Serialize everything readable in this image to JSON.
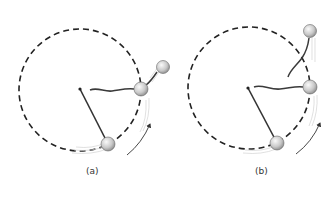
{
  "figure": {
    "panels": [
      {
        "id": "a",
        "caption": "(a)",
        "caption_pos": [
          92,
          172
        ],
        "circle": {
          "cx": 80,
          "cy": 90,
          "r": 61
        },
        "pivot": [
          80,
          89
        ],
        "rod_ball": [
          108,
          144
        ],
        "string_ball": [
          141,
          89
        ],
        "loose_ball": [
          163,
          67
        ],
        "arrow": {
          "from": [
            127,
            155
          ],
          "to": [
            151,
            123
          ]
        }
      },
      {
        "id": "b",
        "caption": "(b)",
        "caption_pos": [
          260,
          172
        ],
        "circle": {
          "cx": 249,
          "cy": 88,
          "r": 61
        },
        "pivot": [
          248,
          88
        ],
        "rod_ball": [
          277,
          143
        ],
        "string_ball": [
          310,
          87
        ],
        "loose_ball": [
          310,
          31
        ],
        "arrow": {
          "from": [
            296,
            154
          ],
          "to": [
            321,
            121
          ]
        }
      }
    ],
    "colors": {
      "circle": "#222222",
      "rod": "#333333",
      "string": "#3a3a3a",
      "ball_light": "#f2f2f2",
      "ball_dark": "#9a9a9a",
      "ball_edge": "#666666",
      "motion_trail": "#d0d0d0",
      "arrow": "#333333"
    }
  }
}
